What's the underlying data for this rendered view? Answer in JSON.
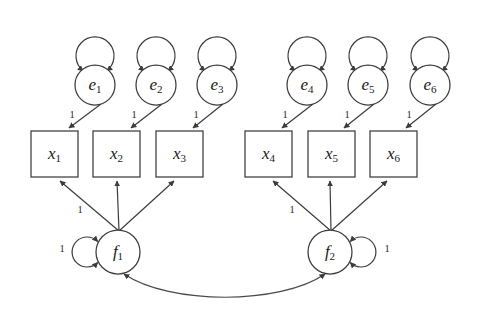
{
  "figure": {
    "type": "sem-path-diagram",
    "background_color": "#ffffff",
    "stroke_color": "#3c3c3c",
    "width": 485,
    "height": 324
  },
  "nodes": {
    "errors": [
      {
        "id": "e1",
        "base": "e",
        "sub": "1",
        "shape": "circle",
        "cx": 95,
        "cy": 85,
        "r": 20
      },
      {
        "id": "e2",
        "base": "e",
        "sub": "2",
        "shape": "circle",
        "cx": 156,
        "cy": 85,
        "r": 20
      },
      {
        "id": "e3",
        "base": "e",
        "sub": "3",
        "shape": "circle",
        "cx": 217,
        "cy": 85,
        "r": 20
      },
      {
        "id": "e4",
        "base": "e",
        "sub": "4",
        "shape": "circle",
        "cx": 307,
        "cy": 85,
        "r": 20
      },
      {
        "id": "e5",
        "base": "e",
        "sub": "5",
        "shape": "circle",
        "cx": 368,
        "cy": 85,
        "r": 20
      },
      {
        "id": "e6",
        "base": "e",
        "sub": "6",
        "shape": "circle",
        "cx": 430,
        "cy": 85,
        "r": 20
      }
    ],
    "indicators": [
      {
        "id": "x1",
        "base": "x",
        "sub": "1",
        "shape": "rect",
        "x": 31,
        "y": 131,
        "w": 47,
        "h": 46
      },
      {
        "id": "x2",
        "base": "x",
        "sub": "2",
        "shape": "rect",
        "x": 93,
        "y": 131,
        "w": 47,
        "h": 46
      },
      {
        "id": "x3",
        "base": "x",
        "sub": "3",
        "shape": "rect",
        "x": 156,
        "y": 131,
        "w": 47,
        "h": 46
      },
      {
        "id": "x4",
        "base": "x",
        "sub": "4",
        "shape": "rect",
        "x": 245,
        "y": 131,
        "w": 47,
        "h": 46
      },
      {
        "id": "x5",
        "base": "x",
        "sub": "5",
        "shape": "rect",
        "x": 308,
        "y": 131,
        "w": 47,
        "h": 46
      },
      {
        "id": "x6",
        "base": "x",
        "sub": "6",
        "shape": "rect",
        "x": 370,
        "y": 131,
        "w": 47,
        "h": 46
      }
    ],
    "factors": [
      {
        "id": "f1",
        "base": "f",
        "sub": "1",
        "shape": "circle",
        "cx": 118,
        "cy": 252,
        "r": 22
      },
      {
        "id": "f2",
        "base": "f",
        "sub": "2",
        "shape": "circle",
        "cx": 330,
        "cy": 252,
        "r": 22
      }
    ]
  },
  "self_loops": {
    "error_variances": [
      {
        "id": "e1-loop",
        "cx": 95,
        "cy": 56,
        "r": 19,
        "label": ""
      },
      {
        "id": "e2-loop",
        "cx": 156,
        "cy": 56,
        "r": 19,
        "label": ""
      },
      {
        "id": "e3-loop",
        "cx": 217,
        "cy": 56,
        "r": 19,
        "label": ""
      },
      {
        "id": "e4-loop",
        "cx": 307,
        "cy": 56,
        "r": 19,
        "label": ""
      },
      {
        "id": "e5-loop",
        "cx": 368,
        "cy": 56,
        "r": 19,
        "label": ""
      },
      {
        "id": "e6-loop",
        "cx": 430,
        "cy": 56,
        "r": 19,
        "label": ""
      }
    ],
    "factor_variances": [
      {
        "id": "f1-loop",
        "cx": 87,
        "cy": 252,
        "r": 15,
        "side": "left",
        "label": "1",
        "label_x": 62,
        "label_y": 250
      },
      {
        "id": "f2-loop",
        "cx": 361,
        "cy": 252,
        "r": 15,
        "side": "right",
        "label": "1",
        "label_x": 387,
        "label_y": 250
      }
    ]
  },
  "edges": {
    "error_to_indicator": [
      {
        "id": "e1-x1",
        "from": "e1",
        "to": "x1",
        "x1": 101,
        "y1": 104,
        "x2": 69,
        "y2": 128,
        "label": "1",
        "label_x": 72,
        "label_y": 116
      },
      {
        "id": "e2-x2",
        "from": "e2",
        "to": "x2",
        "x1": 162,
        "y1": 104,
        "x2": 131,
        "y2": 128,
        "label": "1",
        "label_x": 134,
        "label_y": 116
      },
      {
        "id": "e3-x3",
        "from": "e3",
        "to": "x3",
        "x1": 223,
        "y1": 104,
        "x2": 193,
        "y2": 128,
        "label": "1",
        "label_x": 196,
        "label_y": 116
      },
      {
        "id": "e4-x4",
        "from": "e4",
        "to": "x4",
        "x1": 313,
        "y1": 104,
        "x2": 282,
        "y2": 128,
        "label": "1",
        "label_x": 285,
        "label_y": 116
      },
      {
        "id": "e5-x5",
        "from": "e5",
        "to": "x5",
        "x1": 374,
        "y1": 104,
        "x2": 344,
        "y2": 128,
        "label": "1",
        "label_x": 347,
        "label_y": 116
      },
      {
        "id": "e6-x6",
        "from": "e6",
        "to": "x6",
        "x1": 436,
        "y1": 104,
        "x2": 406,
        "y2": 128,
        "label": "1",
        "label_x": 409,
        "label_y": 116
      }
    ],
    "factor_to_indicator": [
      {
        "id": "f1-x1",
        "from": "f1",
        "to": "x1",
        "x1": 119,
        "y1": 231,
        "x2": 60,
        "y2": 181,
        "label": "1",
        "label_x": 80,
        "label_y": 211
      },
      {
        "id": "f1-x2",
        "from": "f1",
        "to": "x2",
        "x1": 119,
        "y1": 231,
        "x2": 117,
        "y2": 181,
        "label": "",
        "label_x": 0,
        "label_y": 0
      },
      {
        "id": "f1-x3",
        "from": "f1",
        "to": "x3",
        "x1": 119,
        "y1": 231,
        "x2": 174,
        "y2": 181,
        "label": "",
        "label_x": 0,
        "label_y": 0
      },
      {
        "id": "f2-x4",
        "from": "f2",
        "to": "x4",
        "x1": 331,
        "y1": 231,
        "x2": 273,
        "y2": 181,
        "label": "1",
        "label_x": 292,
        "label_y": 211
      },
      {
        "id": "f2-x5",
        "from": "f2",
        "to": "x5",
        "x1": 331,
        "y1": 231,
        "x2": 330,
        "y2": 181,
        "label": "",
        "label_x": 0,
        "label_y": 0
      },
      {
        "id": "f2-x6",
        "from": "f2",
        "to": "x6",
        "x1": 331,
        "y1": 231,
        "x2": 387,
        "y2": 181,
        "label": "",
        "label_x": 0,
        "label_y": 0
      }
    ],
    "factor_covariance": {
      "id": "f1-f2-cov",
      "from": "f1",
      "to": "f2",
      "path": "M 124 274 C 170 305, 280 305, 325 274",
      "label": "",
      "double_headed": true
    }
  }
}
